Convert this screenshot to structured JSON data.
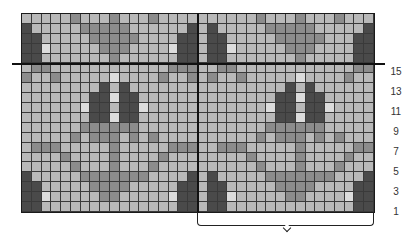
{
  "chart_title": "",
  "colors": {
    "L": "#b9b9b9",
    "V": "#dcdcdc",
    "M": "#8c8c8c",
    "D": "#4a4a4a"
  },
  "grid": {
    "columns": 36,
    "rows": 20,
    "rows_top_to_bottom": [
      "LLLLLMLLLMLLLMLLLLLLLLLLMLLLMLLLMLLL",
      "DLLLLLMMMMMLLLLLLDLDLLLLLMMMMMLLLLLD",
      "DDLLLLLMMMMMLLLLDDLDDLLLLLMMMMMLLLDD",
      "DDVLLLLLMMMLLLLVDDLDDVLLLLLMMMLLLLDD",
      "DDLLLLLLLMLLLLLLDDLDDLLLLLLLMLLLLLDD",
      "LMMLLLLLLLLLLLLMMMLLMMLLLLLLLLLLLLMM",
      "MLLMLLLLLVLLLLMLLMLMLLMLLLLLVLLLLMLL",
      "LLLLLLLLDLDLLLLLLLLLLLLLLLLDLDLLLLLL",
      "LLLLLLLDDVDDLLLLLLLLLLLLLLDDVDDLLLLL",
      "LLLLLLVDDLDDVLLLLLLLLLLLLVDDLDDVLLLL",
      "LLLLLLLDDVDDLLLLLLLLLLLLLLDDVDDLLLLL",
      "LLLLLLMMMMMMLLLLLLLLLLLLLMMMMMMLLLLL",
      "LLLLLMLMMMLMLMLLLLLLLLLLMLMMMLMLMLLL",
      "LMMMLLLLLMLLLLLMMMLLMMMLLLLLMLLLLLMM",
      "LLLLMLLLLMLLLLMLLLLLLLLMLLLLMLLLLMLL",
      "LLLLLMLLLMLLLMLLLLLLLLLLMLLLMLLLMLLL",
      "DLLLLLMMMMMMMLLLLDLDLLLLLMMMMMMMLLLD",
      "DDLLLLLMMMMLLLLLDDLDDLLLLLMMMMLLLLDD",
      "DDVLLLLLMMLLLLLVDDLDDVLLLLLMMLLLLVDD",
      "DDLLLLLLLLLLLLLLDDLDDLLLLLLLLLLLLLDD"
    ]
  },
  "row_labels": [
    {
      "text": "15",
      "top": 66
    },
    {
      "text": "13",
      "top": 86
    },
    {
      "text": "11",
      "top": 106
    },
    {
      "text": "9",
      "top": 126
    },
    {
      "text": "7",
      "top": 146
    },
    {
      "text": "5",
      "top": 166
    },
    {
      "text": "3",
      "top": 186
    },
    {
      "text": "1",
      "top": 206
    }
  ],
  "annotations": {
    "bracket": "pattern repeat",
    "horizontal_divider": "after row 15",
    "vertical_divider": "between repeats"
  }
}
